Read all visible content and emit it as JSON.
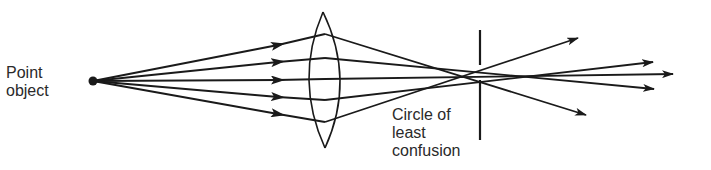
{
  "labels": {
    "point_object_line1": "Point",
    "point_object_line2": "object",
    "circle_line1": "Circle of",
    "circle_line2": "least",
    "circle_line3": "confusion"
  },
  "colors": {
    "ink": "#1a1a1a",
    "background": "#ffffff"
  },
  "geometry": {
    "point_object": {
      "x": 93,
      "y": 81
    },
    "lens": {
      "top": [
        323,
        12
      ],
      "bottom": [
        325,
        148
      ],
      "left_x": 307,
      "right_x": 343
    },
    "stop_line": {
      "x": 480,
      "segments": [
        [
          30,
          65
        ],
        [
          80,
          140
        ]
      ]
    },
    "rays": [
      {
        "lens_y": 34,
        "end": [
          578,
          38
        ]
      },
      {
        "lens_y": 58,
        "end": [
          653,
          62
        ]
      },
      {
        "lens_y": 79,
        "end": [
          673,
          74
        ]
      },
      {
        "lens_y": 100,
        "end": [
          654,
          89
        ]
      },
      {
        "lens_y": 122,
        "end": [
          586,
          115
        ]
      }
    ]
  }
}
